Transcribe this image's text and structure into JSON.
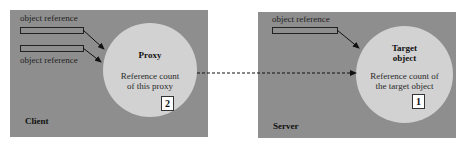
{
  "client": {
    "label": "Client",
    "refs": [
      "object reference",
      "object reference"
    ],
    "proxy": {
      "title": "Proxy",
      "desc_line1": "Reference count",
      "desc_line2": "of this proxy",
      "count": "2"
    }
  },
  "server": {
    "label": "Server",
    "refs": [
      "object reference"
    ],
    "target": {
      "title_line1": "Target",
      "title_line2": "object",
      "desc_line1": "Reference count of",
      "desc_line2": "the target object",
      "count": "1"
    }
  },
  "colors": {
    "panel": "#8e8e8e",
    "circle": "#d2d2d2"
  }
}
